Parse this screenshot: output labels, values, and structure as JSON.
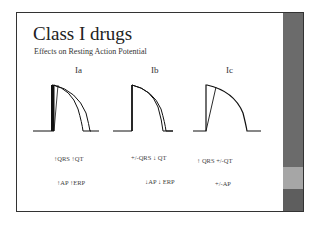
{
  "slide": {
    "title": "Class I drugs",
    "subtitle": "Effects on Resting Action Potential",
    "columns": [
      {
        "label": "Ia",
        "effect_line1": "↑QRS ↑QT",
        "effect_line2": "↑AP ↑ERP",
        "curve_note": "prolonged action potential, slowed phase 0"
      },
      {
        "label": "Ib",
        "effect_line1": "+/-QRS ↓ QT",
        "effect_line2": "↓AP ↓ ERP",
        "curve_note": "shortened action potential"
      },
      {
        "label": "Ic",
        "effect_line1": "↑ QRS +/-QT",
        "effect_line2": "+/-AP",
        "curve_note": "markedly slowed phase 0, unchanged duration"
      }
    ]
  },
  "colors": {
    "sidebar": "#6b6b6b",
    "sidebar_band_light": "#a6a6a6",
    "sidebar_band_dark": "#5e5e5e",
    "border": "#333333",
    "text": "#222222"
  }
}
